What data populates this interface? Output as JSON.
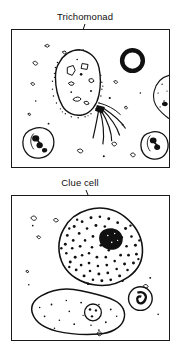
{
  "figure": {
    "type": "scientific-illustration",
    "panel_count": 2,
    "ink_color": "#111111",
    "background_color": "#ffffff"
  },
  "panels": [
    {
      "id": "top",
      "name": "trichomonad-panel",
      "labels": [
        {
          "name": "trichomonad",
          "text": "Trichomonad"
        },
        {
          "name": "white-blood-cells",
          "text": "White\nblood\ncells"
        }
      ],
      "features": [
        {
          "name": "trichomonad-cell",
          "description": "pear-shaped protozoan with stippled membrane, internal vacuoles and four flagella"
        },
        {
          "name": "white-blood-cell-left",
          "description": "round leukocyte with dark lobed nucleus"
        },
        {
          "name": "white-blood-cell-right",
          "description": "round leukocyte with dark lobed nucleus at right edge"
        },
        {
          "name": "yeast-ring",
          "description": "thick black ring artifact upper right"
        },
        {
          "name": "epithelial-cell-edge",
          "description": "partial pale epithelial cell at right border"
        },
        {
          "name": "debris-specks",
          "description": "scattered small dark debris particles"
        }
      ]
    },
    {
      "id": "bottom",
      "name": "clue-cell-panel",
      "labels": [
        {
          "name": "clue-cell",
          "text": "Clue cell"
        },
        {
          "name": "normal-epithelial-cell",
          "text": "Normal\nepithelial\ncell"
        },
        {
          "name": "white-blood-cell",
          "text": "White blood\ncell"
        }
      ],
      "features": [
        {
          "name": "clue-cell",
          "description": "irregular epithelial cell densely stippled with adherent bacteria and a dark nucleus"
        },
        {
          "name": "normal-epithelial-cell",
          "description": "large pale squamous cell with sparse granules and small round nucleus"
        },
        {
          "name": "white-blood-cell",
          "description": "small round leukocyte with curled dark nucleus"
        },
        {
          "name": "debris-specks",
          "description": "scattered small dark debris particles"
        }
      ]
    }
  ]
}
